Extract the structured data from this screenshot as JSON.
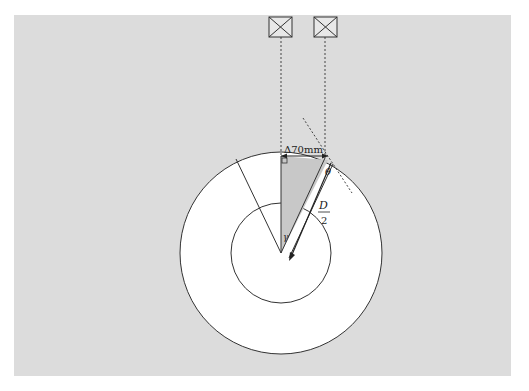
{
  "diagram": {
    "dimension_label": "Δ70mm",
    "angle_label_theta": "θ",
    "angle_label_gamma": "γ",
    "radius_label_num": "D",
    "radius_label_den": "2",
    "sensors": [
      {
        "name": "sensor-left",
        "icon": "boxed-x-icon"
      },
      {
        "name": "sensor-right",
        "icon": "boxed-x-icon"
      }
    ],
    "colors": {
      "background_panel": "#dcdcdc",
      "circle_fill": "#ffffff",
      "stroke": "#333333",
      "shaded_triangle": "#c8c8c8"
    }
  }
}
